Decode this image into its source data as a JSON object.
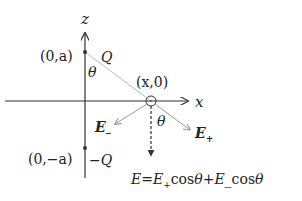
{
  "diagram": {
    "axes": {
      "z_label": "z",
      "x_label": "x"
    },
    "points": {
      "top_charge_coord": "(0,a)",
      "top_charge_label": "Q",
      "bottom_charge_coord": "(0,−a)",
      "bottom_charge_label": "−Q",
      "field_point_coord": "(x,0)"
    },
    "angles": {
      "theta_at_top": "θ",
      "theta_at_field_point": "θ"
    },
    "vectors": {
      "e_plus_base": "E",
      "e_plus_sub": "+",
      "e_minus_base": "E",
      "e_minus_sub": "_"
    },
    "equation": {
      "lhs": "E=",
      "t1_base": "E",
      "t1_sub": "+",
      "t1_fn": "cos",
      "t1_arg": "θ",
      "plus": "+",
      "t2_base": "E",
      "t2_sub": "_",
      "t2_fn": "cos",
      "t2_arg": "θ"
    },
    "colors": {
      "axis": "#333333",
      "guide_line": "#bbbbbb",
      "vector": "#999999",
      "text": "#222222"
    }
  }
}
